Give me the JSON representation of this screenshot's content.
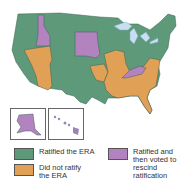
{
  "colors": {
    "ratified": "#5e9a7a",
    "not_ratified": "#e0a055",
    "rescinded": "#b383c0",
    "water": "#c8dff0",
    "border": "#3f5f55"
  },
  "legend": [
    {
      "key": "ratified",
      "label": "Ratified the ERA"
    },
    {
      "key": "not_ratified",
      "label": "Did not ratify the ERA"
    },
    {
      "key": "rescinded",
      "label": "Ratified and then voted to rescind ratification"
    }
  ],
  "states": {
    "rescinded": [
      "Idaho",
      "South Dakota",
      "Nebraska",
      "Kentucky",
      "Tennessee",
      "Alaska"
    ],
    "not_ratified": [
      "Nevada",
      "Utah",
      "Arizona",
      "Oklahoma",
      "Missouri",
      "Illinois",
      "Arkansas",
      "Louisiana",
      "Mississippi",
      "Alabama",
      "Georgia",
      "Florida",
      "South Carolina",
      "North Carolina",
      "Virginia"
    ],
    "ratified": [
      "Washington",
      "Oregon",
      "California",
      "Montana",
      "Wyoming",
      "Colorado",
      "New Mexico",
      "North Dakota",
      "Kansas",
      "Texas",
      "Minnesota",
      "Iowa",
      "Wisconsin",
      "Michigan",
      "Indiana",
      "Ohio",
      "Pennsylvania",
      "New York",
      "West Virginia",
      "Maryland",
      "Delaware",
      "New Jersey",
      "Connecticut",
      "Rhode Island",
      "Massachusetts",
      "Vermont",
      "New Hampshire",
      "Maine",
      "Hawaii"
    ]
  }
}
